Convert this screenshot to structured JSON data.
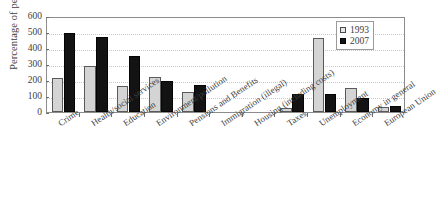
{
  "chart_data": {
    "type": "bar",
    "title": "",
    "xlabel": "",
    "ylabel": "Percentage of people",
    "ylim": [
      0,
      600
    ],
    "yticks": [
      0,
      100,
      200,
      300,
      400,
      500,
      600
    ],
    "grid": true,
    "legend_position": "top-right",
    "categories": [
      "Crime",
      "Health/social services",
      "Education",
      "Environment/pollution",
      "Pensions and Benefits",
      "Immigration (illegal)",
      "Housing (including costs)",
      "Taxes",
      "Unemployment",
      "Economy in general",
      "European Union"
    ],
    "series": [
      {
        "name": "1993",
        "color": "#d4d4d4",
        "values": [
          210,
          290,
          165,
          220,
          125,
          0,
          0,
          25,
          460,
          150,
          30
        ]
      },
      {
        "name": "2007",
        "color": "#131313",
        "values": [
          495,
          470,
          350,
          195,
          170,
          0,
          0,
          110,
          110,
          90,
          35
        ]
      }
    ]
  },
  "axis": {
    "y_title": "Percentage of people",
    "y_tick_labels": [
      "600",
      "500",
      "400",
      "300",
      "200",
      "100",
      "0"
    ]
  },
  "legend": {
    "entries": [
      {
        "label": "1993",
        "swatch": "light-square-swatch"
      },
      {
        "label": "2007",
        "swatch": "dark-square-swatch"
      }
    ]
  }
}
